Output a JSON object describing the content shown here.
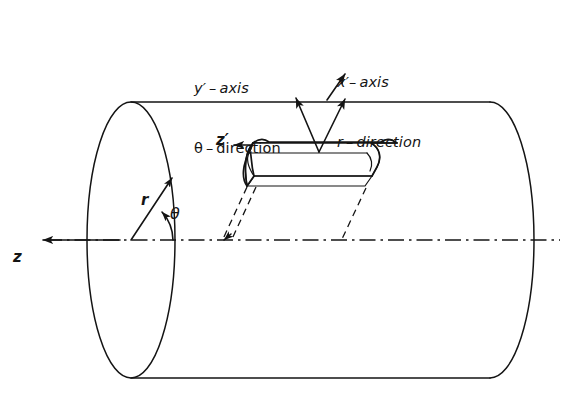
{
  "figure": {
    "background_color": "#ffffff",
    "line_color": "#141414"
  },
  "labels": {
    "y_prime_axis": "y′ – axis",
    "theta_direction": "θ – direction",
    "x_prime_axis": "x′– axis",
    "r_direction": "r – direction",
    "z_axis": "z",
    "z_prime_axis": "z′",
    "radius": "r",
    "theta_angle": "θ"
  },
  "geometry": {
    "cylinder": {
      "left_ellipse_center_x": 131,
      "left_ellipse_center_y": 240,
      "left_ellipse_rx": 44,
      "left_ellipse_ry": 138,
      "right_arc_center_x": 490,
      "right_arc_center_y": 240,
      "right_arc_rx": 44,
      "right_arc_ry": 138,
      "top_edge_y": 102,
      "bottom_edge_y": 378
    },
    "element": {
      "description": "curved differential shell element on cylinder surface",
      "near_top_left_x": 252,
      "near_top_left_y": 142,
      "length_x": 118
    },
    "centerline": {
      "y": 240,
      "x_start": 18,
      "x_end": 560
    }
  },
  "icons": {
    "z_arrow": "arrow-left-icon",
    "z_prime_arrow": "arrow-left-icon",
    "r_arrow": "arrow-up-right-icon",
    "theta_arrow": "arc-arrow-icon",
    "leader_y_prime": "leader-arrow-icon",
    "leader_x_prime": "leader-arrow-icon"
  }
}
